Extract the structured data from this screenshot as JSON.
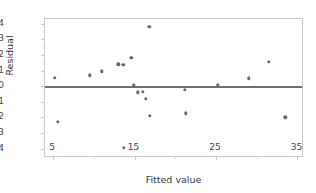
{
  "chart_data": {
    "type": "scatter",
    "title": "",
    "xlabel": "Fitted value",
    "ylabel": "Residual",
    "xlim": [
      4.0,
      35.8
    ],
    "ylim": [
      -4.6,
      4.3
    ],
    "xticks": [
      5,
      15,
      25,
      35
    ],
    "xtick_labels": [
      "5",
      "15",
      "25",
      "35"
    ],
    "yticks": [
      -4,
      -3,
      -2,
      -1,
      0,
      1,
      2,
      3,
      4
    ],
    "ytick_labels": [
      "-4",
      "-3",
      "-2",
      "-1",
      "0",
      "1",
      "2",
      "3",
      "4"
    ],
    "grid": false,
    "legend": false,
    "reference_line": {
      "orientation": "horizontal",
      "y": 0,
      "color": "#6f6f6f"
    },
    "marker": {
      "shape": "circle",
      "color": "#6b6b6b",
      "size": 3.4
    },
    "frame_color": "#c9c9c9",
    "background": "#ffffff",
    "points": [
      {
        "x": 5.2,
        "y": 0.55
      },
      {
        "x": 5.6,
        "y": -2.3
      },
      {
        "x": 9.5,
        "y": 0.7
      },
      {
        "x": 11.0,
        "y": 0.95
      },
      {
        "x": 13.0,
        "y": 1.4
      },
      {
        "x": 13.6,
        "y": 1.35
      },
      {
        "x": 13.7,
        "y": -3.95
      },
      {
        "x": 14.6,
        "y": 1.8
      },
      {
        "x": 14.9,
        "y": 0.05
      },
      {
        "x": 15.4,
        "y": -0.4
      },
      {
        "x": 16.0,
        "y": -0.35
      },
      {
        "x": 16.4,
        "y": -0.8
      },
      {
        "x": 16.8,
        "y": 3.8
      },
      {
        "x": 16.9,
        "y": -1.9
      },
      {
        "x": 21.2,
        "y": -0.25
      },
      {
        "x": 21.3,
        "y": -1.75
      },
      {
        "x": 25.2,
        "y": 0.05
      },
      {
        "x": 29.0,
        "y": 0.5
      },
      {
        "x": 31.5,
        "y": 1.55
      },
      {
        "x": 33.5,
        "y": -2.0
      }
    ]
  }
}
